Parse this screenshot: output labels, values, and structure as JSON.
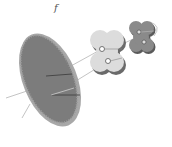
{
  "figure": {
    "panel_label": "f",
    "components": [
      {
        "name": "large-disc",
        "description": "large tilted striated oval disc",
        "color": "#7a7a7a"
      },
      {
        "name": "flower-shape-light",
        "description": "light grey four-lobed flower shape with two holes",
        "color": "#d8d8d8"
      },
      {
        "name": "flower-shape-dark",
        "description": "dark grey four-lobed flower shape with two holes",
        "color": "#8a8a8a"
      }
    ],
    "colors": {
      "disc_fill": "#7a7a7a",
      "disc_rim": "#a9a9a9",
      "light_flower": "#dcdcdc",
      "dark_flower": "#858585",
      "axis_line": "#bdbdbd"
    }
  }
}
